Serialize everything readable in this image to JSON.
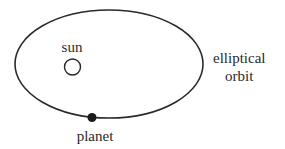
{
  "diagram": {
    "labels": {
      "sun": "sun",
      "orbit_line1": "elliptical",
      "orbit_line2": "orbit",
      "planet": "planet"
    },
    "colors": {
      "stroke": "#2a2a2a",
      "planet_fill": "#1a1a1a",
      "background": "#ffffff"
    }
  }
}
